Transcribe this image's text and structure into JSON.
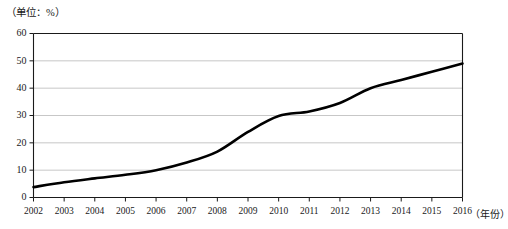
{
  "chart_data": {
    "type": "line",
    "title": "",
    "unit_label": "（单位：%）",
    "xlabel": "（年份）",
    "ylabel": "",
    "categories": [
      "2002",
      "2003",
      "2004",
      "2005",
      "2006",
      "2007",
      "2008",
      "2009",
      "2010",
      "2011",
      "2012",
      "2013",
      "2014",
      "2015",
      "2016"
    ],
    "x": [
      2002,
      2003,
      2004,
      2005,
      2006,
      2007,
      2008,
      2009,
      2010,
      2011,
      2012,
      2013,
      2014,
      2015,
      2016
    ],
    "values": [
      3.8,
      5.6,
      7.0,
      8.3,
      10.0,
      12.8,
      16.8,
      24.0,
      29.8,
      31.5,
      34.6,
      40.0,
      43.0,
      46.0,
      49.0
    ],
    "series": [
      {
        "name": "",
        "values": [
          3.8,
          5.6,
          7.0,
          8.3,
          10.0,
          12.8,
          16.8,
          24.0,
          29.8,
          31.5,
          34.6,
          40.0,
          43.0,
          46.0,
          49.0
        ],
        "color": "#000000"
      }
    ],
    "ylim": [
      0,
      60
    ],
    "yticks": [
      0,
      10,
      20,
      30,
      40,
      50,
      60
    ],
    "ytick_labels": [
      "0",
      "10",
      "20",
      "30",
      "40",
      "50",
      "60"
    ],
    "xlim": [
      2002,
      2016
    ],
    "grid": true,
    "grid_axis": "y",
    "legend": false,
    "legend_position": "none",
    "line_color": "#000000",
    "grid_color": "#b9b9b9",
    "axis_color": "#1a1a1a",
    "background_color": "#ffffff"
  }
}
